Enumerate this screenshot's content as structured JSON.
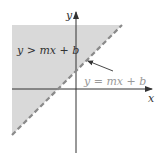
{
  "diagram": {
    "region_label": "y > mx + b",
    "boundary_label": "y = mx + b",
    "x_axis_label": "x",
    "y_axis_label": "y",
    "boundary_style": "dashed",
    "colors": {
      "region_fill": "#d9d9d9",
      "boundary_line": "#8a8a8a",
      "axis": "#333333",
      "region_text": "#333333",
      "boundary_text": "#9a9a9a",
      "leader_arrow": "#333333"
    }
  }
}
